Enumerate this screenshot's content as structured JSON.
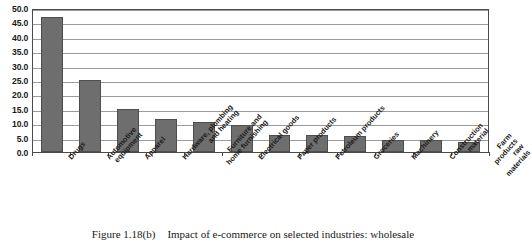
{
  "figure": {
    "number": "Figure 1.18(b)",
    "caption": "Impact of e-commerce on selected industries: wholesale"
  },
  "chart_data": {
    "type": "bar",
    "title": "Impact of e-commerce on selected industries: wholesale",
    "xlabel": "",
    "ylabel": "",
    "ylim": [
      0.0,
      50.0
    ],
    "ytick_step": 5.0,
    "grid": true,
    "legend": "none",
    "bar_color": "#6e6e6e",
    "ytick_labels": [
      "0.0",
      "5.0",
      "10.0",
      "15.0",
      "20.0",
      "25.0",
      "30.0",
      "35.0",
      "40.0",
      "45.0",
      "50.0"
    ],
    "categories": [
      "Drugs",
      "Automotive equipment",
      "Apparel",
      "Hardware, plumbing and heating",
      "Furniture and home furnishing",
      "Electrical goods",
      "Paper products",
      "Petroleum products",
      "Groceries",
      "Machinery",
      "Construction material",
      "Farm products raw materials"
    ],
    "category_lines": [
      [
        "Drugs"
      ],
      [
        "Automotive",
        "equipment"
      ],
      [
        "Apparel"
      ],
      [
        "Hardware, plumbing",
        "and heating"
      ],
      [
        "Furniture and",
        "home furnishing"
      ],
      [
        "Electrical goods"
      ],
      [
        "Paper products"
      ],
      [
        "Petroleum products"
      ],
      [
        "Groceries"
      ],
      [
        "Machinery"
      ],
      [
        "Construction material"
      ],
      [
        "Farm products raw",
        "materials"
      ]
    ],
    "values": [
      47.0,
      25.0,
      15.0,
      11.5,
      10.5,
      9.5,
      6.0,
      6.0,
      5.5,
      4.0,
      4.0,
      3.5
    ]
  }
}
